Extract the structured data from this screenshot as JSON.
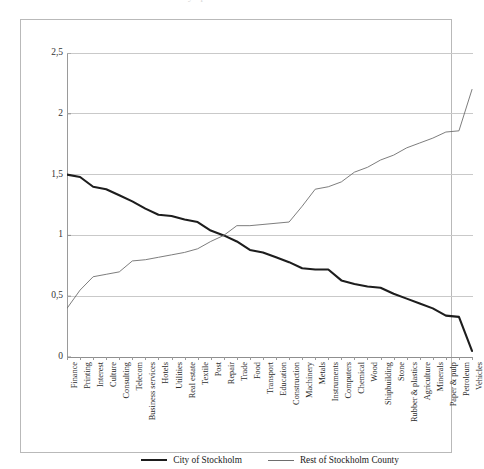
{
  "top_clip_ghost": "Relative industry specialisation",
  "legend": {
    "entries": [
      {
        "label": "City of Stockholm",
        "style": "thick",
        "color": "#1d1d1d"
      },
      {
        "label": "Rest of Stockholm County",
        "style": "thin",
        "color": "#6e6e6e"
      }
    ]
  },
  "colors": {
    "series_city": "#1d1d1d",
    "series_county": "#6e6e6e",
    "gridline": "#c9c9c9",
    "axis": "#8f8f8f",
    "frame": "#b9b9b9",
    "background": "#ffffff"
  },
  "chart_data": {
    "type": "line",
    "title": "",
    "xlabel": "",
    "ylabel": "",
    "ylim": [
      0,
      2.5
    ],
    "yticks": [
      0,
      0.5,
      1,
      1.5,
      2,
      2.5
    ],
    "ytick_labels": [
      "0",
      "0,5",
      "1",
      "1,5",
      "2",
      "2,5"
    ],
    "decimal_separator": ",",
    "grid": true,
    "legend_position": "bottom",
    "categories": [
      "Finance",
      "Printing",
      "Interest",
      "Culture",
      "Consulting",
      "Telecom",
      "Business services",
      "Hotels",
      "Utilities",
      "Real estate",
      "Textile",
      "Post",
      "Repair",
      "Trade",
      "Food",
      "Transport",
      "Education",
      "Construction",
      "Machinery",
      "Metals",
      "Instruments",
      "Computers",
      "Chemical",
      "Wood",
      "Shipbuilding",
      "Stone",
      "Rubber & plastics",
      "Agriculture",
      "Minerals",
      "Paper & pulp",
      "Petroleum",
      "Vehicles"
    ],
    "series": [
      {
        "name": "City of Stockholm",
        "style": "thick",
        "color": "#1d1d1d",
        "values": [
          1.5,
          1.48,
          1.4,
          1.38,
          1.33,
          1.28,
          1.22,
          1.17,
          1.16,
          1.13,
          1.11,
          1.04,
          1.0,
          0.95,
          0.88,
          0.86,
          0.82,
          0.78,
          0.73,
          0.72,
          0.72,
          0.63,
          0.6,
          0.58,
          0.57,
          0.52,
          0.48,
          0.44,
          0.4,
          0.34,
          0.33,
          0.05
        ]
      },
      {
        "name": "Rest of Stockholm County",
        "style": "thin",
        "color": "#6e6e6e",
        "values": [
          0.4,
          0.55,
          0.66,
          0.68,
          0.7,
          0.79,
          0.8,
          0.82,
          0.84,
          0.86,
          0.89,
          0.95,
          1.0,
          1.08,
          1.08,
          1.09,
          1.1,
          1.11,
          1.24,
          1.38,
          1.4,
          1.44,
          1.52,
          1.56,
          1.62,
          1.66,
          1.72,
          1.76,
          1.8,
          1.85,
          1.86,
          2.2
        ]
      }
    ]
  }
}
